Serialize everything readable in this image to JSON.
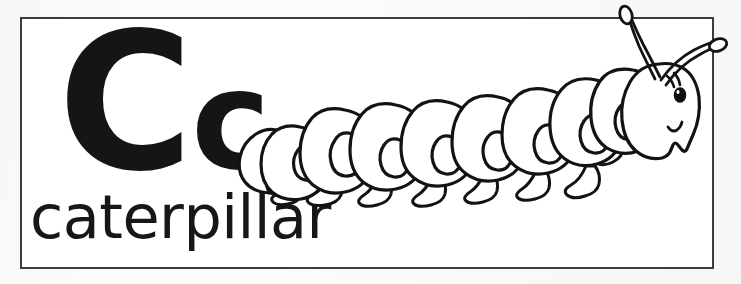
{
  "card": {
    "kind": "alphabet-flashcard",
    "letter_pair": "Cc",
    "letter_uppercase": "C",
    "letter_lowercase": "c",
    "word": "caterpillar",
    "illustration_name": "caterpillar-line-drawing",
    "colors": {
      "ink": "#151515",
      "border": "#3c3c3c",
      "card_background": "#ffffff",
      "page_background": "#fbfbfa"
    }
  },
  "illustration": {
    "subject": "caterpillar",
    "style": "black-and-white line art, uncolored (coloring-page style)",
    "facing": "right",
    "parts": {
      "head_label": "head",
      "eye_label": "eye",
      "antenna_left_label": "antenna-left",
      "antenna_right_label": "antenna-right",
      "mouth_label": "mouth",
      "body_label": "body-segments",
      "spot_label": "segment-spot",
      "leg_label": "leg",
      "tail_label": "tail"
    },
    "counts": {
      "body_segments": 10,
      "spots": 10,
      "legs": 8,
      "antennae": 2,
      "eyes": 1
    }
  }
}
